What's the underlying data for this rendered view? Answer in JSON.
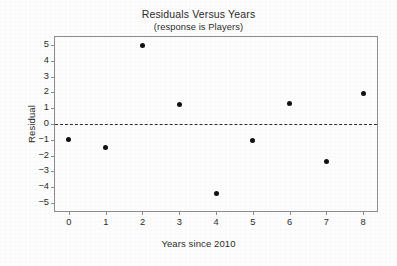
{
  "chart_data": {
    "type": "scatter",
    "title": "Residuals Versus Years",
    "subtitle": "(response is Players)",
    "xlabel": "Years since 2010",
    "ylabel": "Residual",
    "x": [
      0,
      1,
      2,
      3,
      4,
      5,
      6,
      7,
      8
    ],
    "values": [
      -1.0,
      -1.5,
      4.95,
      1.25,
      -4.4,
      -1.05,
      1.3,
      -2.35,
      1.9
    ],
    "series": [
      {
        "name": "Residual",
        "values": [
          -1.0,
          -1.5,
          4.95,
          1.25,
          -4.4,
          -1.05,
          1.3,
          -2.35,
          1.9
        ]
      }
    ],
    "xlim": [
      -0.38,
      8.38
    ],
    "ylim": [
      -5.5,
      5.5
    ],
    "xticks": [
      0,
      1,
      2,
      3,
      4,
      5,
      6,
      7,
      8
    ],
    "xtick_labels": [
      "0",
      "1",
      "2",
      "3",
      "4",
      "5",
      "6",
      "7",
      "8"
    ],
    "yticks": [
      5,
      4,
      3,
      2,
      1,
      0,
      -1,
      -2,
      -3,
      -4,
      -5
    ],
    "ytick_labels": [
      "5",
      "4",
      "3",
      "2",
      "1",
      "0",
      "−1",
      "−2",
      "−3",
      "−4",
      "−5"
    ],
    "grid": false,
    "legend": null,
    "reference_lines": [
      {
        "name": "zero-line",
        "orientation": "horizontal",
        "value": 0,
        "style": "dashed"
      }
    ],
    "marker": {
      "shape": "circle",
      "filled": true,
      "color": "#111111"
    },
    "colors": {
      "marker": "#111111",
      "frame": "#8c8c8c",
      "text": "#2b2b2b",
      "reference_line": "#2e2e2e"
    }
  }
}
